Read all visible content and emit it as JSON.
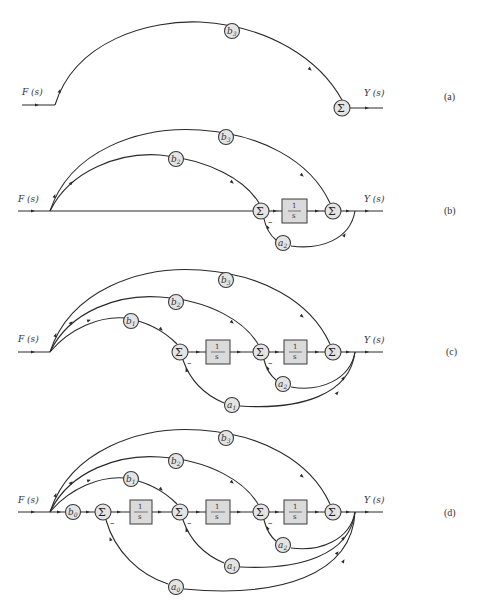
{
  "figure": {
    "input_label": "F (s)",
    "output_label": "Y (s)",
    "sum_symbol": "Σ",
    "integrator_num": "1",
    "integrator_den": "s",
    "minus_sign": "–",
    "panels": [
      {
        "tag": "(a)",
        "gains": [
          {
            "name": "b",
            "sub": "3"
          }
        ],
        "integrators": 0
      },
      {
        "tag": "(b)",
        "gains": [
          {
            "name": "b",
            "sub": "3"
          },
          {
            "name": "b",
            "sub": "2"
          },
          {
            "name": "a",
            "sub": "2"
          }
        ],
        "integrators": 1
      },
      {
        "tag": "(c)",
        "gains": [
          {
            "name": "b",
            "sub": "3"
          },
          {
            "name": "b",
            "sub": "2"
          },
          {
            "name": "b",
            "sub": "1"
          },
          {
            "name": "a",
            "sub": "2"
          },
          {
            "name": "a",
            "sub": "1"
          }
        ],
        "integrators": 2
      },
      {
        "tag": "(d)",
        "gains": [
          {
            "name": "b",
            "sub": "3"
          },
          {
            "name": "b",
            "sub": "2"
          },
          {
            "name": "b",
            "sub": "1"
          },
          {
            "name": "b",
            "sub": "0"
          },
          {
            "name": "a",
            "sub": "2"
          },
          {
            "name": "a",
            "sub": "1"
          },
          {
            "name": "a",
            "sub": "0"
          }
        ],
        "integrators": 3
      }
    ]
  },
  "colors": {
    "node_fill": "#e4e4e4",
    "box_fill": "#dadada",
    "line": "#2a2a2a"
  }
}
